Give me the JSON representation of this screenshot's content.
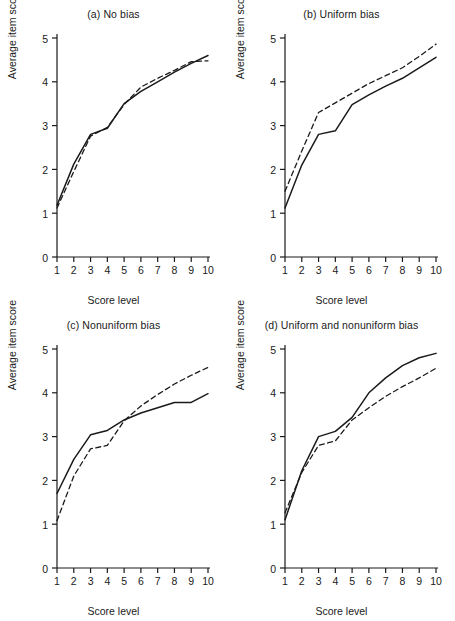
{
  "figure": {
    "background": "#ffffff",
    "ink_color": "#1a1a1a",
    "panel_count": 4
  },
  "axes": {
    "xlabel": "Score level",
    "ylabel": "Average item score",
    "xticks": [
      "1",
      "2",
      "3",
      "4",
      "5",
      "6",
      "7",
      "8",
      "9",
      "10"
    ],
    "yticks": [
      "0",
      "1",
      "2",
      "3",
      "4",
      "5"
    ],
    "xlim": [
      1,
      10
    ],
    "ylim": [
      0,
      5
    ]
  },
  "chart_data": [
    {
      "type": "line",
      "panel": "a",
      "title": "(a) No bias",
      "xlabel": "Score level",
      "ylabel": "Average item score",
      "x": [
        1,
        2,
        3,
        4,
        5,
        6,
        7,
        8,
        9,
        10
      ],
      "xlim": [
        1,
        10
      ],
      "ylim": [
        0,
        5
      ],
      "grid": false,
      "legend": "none",
      "series": [
        {
          "name": "reference group",
          "style": "solid",
          "values": [
            1.18,
            2.12,
            2.8,
            2.94,
            3.5,
            3.78,
            4.0,
            4.22,
            4.42,
            4.6
          ]
        },
        {
          "name": "focal group",
          "style": "dashed",
          "values": [
            1.12,
            1.95,
            2.76,
            2.96,
            3.48,
            3.88,
            4.08,
            4.26,
            4.46,
            4.48
          ]
        }
      ]
    },
    {
      "type": "line",
      "panel": "b",
      "title": "(b) Uniform bias",
      "xlabel": "Score level",
      "ylabel": "Average item score",
      "x": [
        1,
        2,
        3,
        4,
        5,
        6,
        7,
        8,
        9,
        10
      ],
      "xlim": [
        1,
        10
      ],
      "ylim": [
        0,
        5
      ],
      "grid": false,
      "legend": "none",
      "series": [
        {
          "name": "reference group",
          "style": "solid",
          "values": [
            1.12,
            2.1,
            2.8,
            2.88,
            3.48,
            3.7,
            3.9,
            4.08,
            4.32,
            4.56
          ]
        },
        {
          "name": "focal group",
          "style": "dashed",
          "values": [
            1.5,
            2.42,
            3.3,
            3.52,
            3.74,
            3.96,
            4.14,
            4.32,
            4.58,
            4.86
          ]
        }
      ]
    },
    {
      "type": "line",
      "panel": "c",
      "title": "(c) Nonuniform bias",
      "xlabel": "Score level",
      "ylabel": "Average item score",
      "x": [
        1,
        2,
        3,
        4,
        5,
        6,
        7,
        8,
        9,
        10
      ],
      "xlim": [
        1,
        10
      ],
      "ylim": [
        0,
        5
      ],
      "grid": false,
      "legend": "none",
      "series": [
        {
          "name": "reference group",
          "style": "solid",
          "values": [
            1.7,
            2.48,
            3.04,
            3.14,
            3.38,
            3.54,
            3.66,
            3.78,
            3.78,
            3.98
          ]
        },
        {
          "name": "focal group",
          "style": "dashed",
          "values": [
            1.08,
            2.1,
            2.72,
            2.8,
            3.36,
            3.7,
            3.96,
            4.2,
            4.4,
            4.58
          ]
        }
      ]
    },
    {
      "type": "line",
      "panel": "d",
      "title": "(d) Uniform and nonuniform bias",
      "xlabel": "Score level",
      "ylabel": "Average item score",
      "x": [
        1,
        2,
        3,
        4,
        5,
        6,
        7,
        8,
        9,
        10
      ],
      "xlim": [
        1,
        10
      ],
      "ylim": [
        0,
        5
      ],
      "grid": false,
      "legend": "none",
      "series": [
        {
          "name": "reference group",
          "style": "solid",
          "values": [
            1.1,
            2.22,
            3.0,
            3.12,
            3.44,
            4.0,
            4.34,
            4.62,
            4.8,
            4.9
          ]
        },
        {
          "name": "focal group",
          "style": "dashed",
          "values": [
            1.26,
            2.18,
            2.8,
            2.9,
            3.38,
            3.66,
            3.92,
            4.14,
            4.34,
            4.56
          ]
        }
      ]
    }
  ]
}
